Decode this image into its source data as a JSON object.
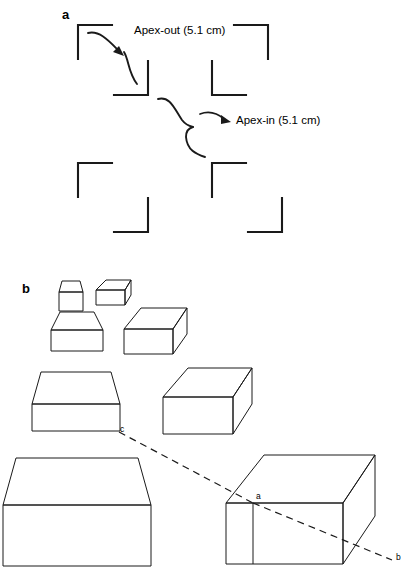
{
  "figure": {
    "width": 419,
    "height": 571,
    "background": "#ffffff",
    "stroke_color": "#1a1a1a",
    "panels": [
      {
        "id": "a",
        "letter": "a",
        "x": 62,
        "y": 20
      },
      {
        "id": "b",
        "letter": "b",
        "x": 22,
        "y": 296
      }
    ]
  },
  "panel_a": {
    "description": "Illusory-contour corner bracket stimuli",
    "annotations": [
      {
        "id": "apex-out",
        "label": "Apex-out (5.1 cm)",
        "x": 134,
        "y": 34,
        "size_cm": 5.1
      },
      {
        "id": "apex-in",
        "label": "Apex-in (5.1 cm)",
        "x": 236,
        "y": 124,
        "size_cm": 5.1
      }
    ],
    "corner_brackets": [
      {
        "id": "tl-outer",
        "corner": "top-left",
        "x": 78,
        "y": 25,
        "arm": 34,
        "orient": "tl"
      },
      {
        "id": "tl-inner",
        "corner": "bottom-right",
        "x": 148,
        "y": 95,
        "arm": 34,
        "orient": "br"
      },
      {
        "id": "tr-outer",
        "corner": "top-right",
        "x": 268,
        "y": 25,
        "arm": 34,
        "orient": "tr"
      },
      {
        "id": "tr-inner",
        "corner": "bottom-left",
        "x": 212,
        "y": 95,
        "arm": 34,
        "orient": "bl"
      },
      {
        "id": "bl-outer",
        "corner": "top-left",
        "x": 78,
        "y": 163,
        "arm": 34,
        "orient": "tl"
      },
      {
        "id": "bl-inner",
        "corner": "bottom-right",
        "x": 148,
        "y": 232,
        "arm": 34,
        "orient": "br"
      },
      {
        "id": "br-outer",
        "corner": "top-left",
        "x": 212,
        "y": 163,
        "arm": 34,
        "orient": "tl"
      },
      {
        "id": "br-inner",
        "corner": "bottom-right",
        "x": 282,
        "y": 232,
        "arm": 34,
        "orient": "br"
      }
    ]
  },
  "panel_b": {
    "description": "Boxes at four increasing sizes in frontal and oblique views",
    "vertex_labels": [
      {
        "id": "c",
        "label": "c",
        "x": 119,
        "y": 431
      },
      {
        "id": "a",
        "label": "a",
        "x": 256,
        "y": 498
      },
      {
        "id": "b",
        "label": "b",
        "x": 396,
        "y": 559
      }
    ],
    "dashed_line": {
      "id": "c-a-b",
      "from": "c",
      "via": "a",
      "to": "b",
      "style": "dashed"
    },
    "boxes": [
      {
        "id": "frontal-1",
        "view": "frontal",
        "scale": 1,
        "cx": 71,
        "top": 281
      },
      {
        "id": "frontal-2",
        "view": "frontal",
        "scale": 2,
        "cx": 76,
        "top": 312
      },
      {
        "id": "frontal-3",
        "view": "frontal",
        "scale": 3,
        "cx": 76,
        "top": 372
      },
      {
        "id": "frontal-4",
        "view": "frontal",
        "scale": 4,
        "cx": 76,
        "top": 458
      },
      {
        "id": "oblique-1",
        "view": "oblique",
        "scale": 1,
        "x": 96,
        "top": 280
      },
      {
        "id": "oblique-2",
        "view": "oblique",
        "scale": 2,
        "x": 124,
        "top": 308
      },
      {
        "id": "oblique-3",
        "view": "oblique",
        "scale": 3,
        "x": 163,
        "top": 368
      },
      {
        "id": "oblique-4",
        "view": "oblique",
        "scale": 4,
        "x": 226,
        "top": 455
      }
    ]
  }
}
